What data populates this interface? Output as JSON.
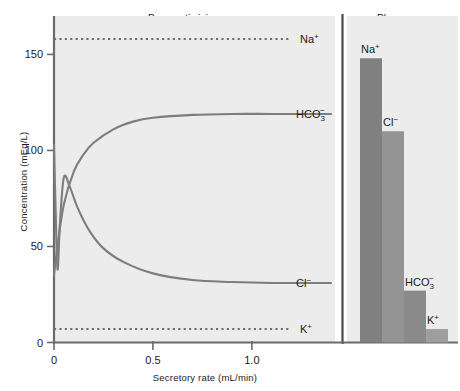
{
  "chart_data": {
    "type": "line",
    "title": "",
    "xlabel": "Secretory rate (mL/min)",
    "ylabel": "Concentration (mEq/L)",
    "xlim": [
      0,
      1.42
    ],
    "ylim": [
      0,
      170
    ],
    "xticks": [
      0,
      0.5,
      1.0
    ],
    "xticklabels": [
      "0",
      "0.5",
      "1.0"
    ],
    "yticks": [
      0,
      50,
      100,
      150
    ],
    "yticklabels": [
      "0",
      "50",
      "100",
      "150"
    ],
    "grid": false,
    "legend": "inline-right-labels",
    "panels": [
      {
        "name": "pancreatic-juice",
        "title": "Pancreatic juice",
        "type": "line",
        "series": [
          {
            "name": "Na+",
            "label": "Na",
            "charge": "+",
            "style": "dotted",
            "color": "#6e6e6e",
            "constant_value": 158,
            "x": [
              0.0,
              0.2,
              0.4,
              0.6,
              0.8,
              1.0,
              1.2,
              1.4
            ],
            "values": [
              158,
              158,
              158,
              158,
              158,
              158,
              158,
              158
            ]
          },
          {
            "name": "HCO3-",
            "label": "HCO",
            "subscript": "3",
            "charge": "−",
            "style": "solid",
            "color": "#7d7d7d",
            "x": [
              0.0,
              0.02,
              0.05,
              0.1,
              0.15,
              0.2,
              0.3,
              0.4,
              0.5,
              0.7,
              0.9,
              1.1,
              1.3,
              1.4
            ],
            "values": [
              35,
              52,
              72,
              89,
              98,
              104,
              111,
              115,
              117,
              118.5,
              119,
              119,
              119,
              119
            ]
          },
          {
            "name": "Cl-",
            "label": "Cl",
            "charge": "−",
            "style": "solid",
            "color": "#7d7d7d",
            "x": [
              0.0,
              0.008,
              0.018,
              0.03,
              0.05,
              0.08,
              0.12,
              0.18,
              0.25,
              0.35,
              0.5,
              0.7,
              0.9,
              1.1,
              1.3,
              1.4
            ],
            "values": [
              103,
              70,
              38,
              62,
              86,
              81,
              70,
              58,
              49,
              42,
              36,
              32.5,
              31.5,
              31,
              31,
              31
            ]
          },
          {
            "name": "K+",
            "label": "K",
            "charge": "+",
            "style": "dotted",
            "color": "#6e6e6e",
            "constant_value": 7,
            "x": [
              0.0,
              0.2,
              0.4,
              0.6,
              0.8,
              1.0,
              1.2,
              1.4
            ],
            "values": [
              7,
              7,
              7,
              7,
              7,
              7,
              7,
              7
            ]
          }
        ]
      },
      {
        "name": "plasma",
        "title": "Plasma",
        "type": "bar",
        "categories": [
          "Na+",
          "Cl-",
          "HCO3-",
          "K+"
        ],
        "category_labels": [
          {
            "label": "Na",
            "charge": "+"
          },
          {
            "label": "Cl",
            "charge": "−"
          },
          {
            "label": "HCO",
            "subscript": "3",
            "charge": "−"
          },
          {
            "label": "K",
            "charge": "+"
          }
        ],
        "values": [
          148,
          110,
          27,
          7
        ],
        "bar_colors": [
          "#808080",
          "#949494",
          "#8a8a8a",
          "#9e9e9e"
        ]
      }
    ]
  },
  "style": {
    "plot_background": "#ececec",
    "axis_color": "#6a6a6a",
    "line_color": "#7d7d7d",
    "dotted_color": "#6e6e6e",
    "divider_color": "#4a4a4a",
    "text_color": "#1a1a1a"
  }
}
